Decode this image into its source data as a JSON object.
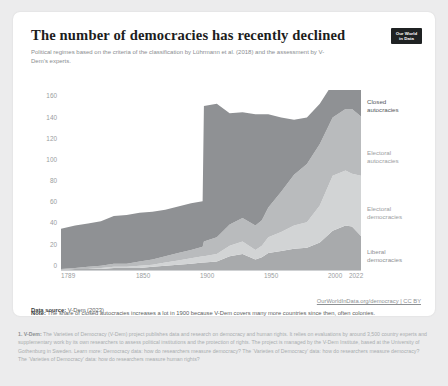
{
  "card": {
    "title": "The number of democracies has recently declined",
    "subtitle": "Political regimes based on the criteria of the classification by Lührmann et al. (2018) and the assessment by V-Dem’s experts.",
    "logo_line1": "Our World",
    "logo_line2": "in Data"
  },
  "footer": {
    "source_label": "Data source:",
    "source_value": "V-Dem (2023)",
    "link": "OurWorldInData.org/democracy | CC BY",
    "note_label": "Note:",
    "note_text": "The share of closed autocracies increases a lot in 1900 because V-Dem covers many more countries since then, often colonies."
  },
  "footnote": {
    "marker": "1. V-Dem:",
    "text": "The Varieties of Democracy (V-Dem) project publishes data and research on democracy and human rights. It relies on evaluations by around 3,500 country experts and supplementary work by its own researchers to assess political institutions and the protection of rights. The project is managed by the V-Dem Institute, based at the University of Gothenburg in Sweden. Learn more: Democracy data: how do researchers measure democracy? The ‘Varieties of Democracy’ data: how do researchers measure democracy? The ‘Varieties of Democracy’ data: how do researchers measure human rights?"
  },
  "chart_data": {
    "type": "area",
    "stacked": true,
    "title": "The number of democracies has recently declined",
    "xlabel": "",
    "ylabel": "",
    "xlim": [
      1789,
      2022
    ],
    "ylim": [
      0,
      170
    ],
    "yticks": [
      0,
      20,
      40,
      60,
      80,
      100,
      120,
      140,
      160
    ],
    "xticks": [
      1789,
      1850,
      1900,
      1950,
      2000,
      2022
    ],
    "grid": false,
    "legend_position": "right",
    "colors": {
      "closed_autocracies": "#8f9194",
      "electoral_autocracies": "#b9bbbd",
      "electoral_democracies": "#d2d4d5",
      "liberal_democracies": "#a8aaac"
    },
    "label_colors": {
      "closed_autocracies": "#55585b",
      "electoral_autocracies": "#9b9ea1",
      "electoral_democracies": "#9b9ea1",
      "liberal_democracies": "#8d9093"
    },
    "x": [
      1789,
      1800,
      1810,
      1820,
      1830,
      1840,
      1850,
      1860,
      1870,
      1880,
      1890,
      1899,
      1900,
      1910,
      1920,
      1930,
      1940,
      1945,
      1950,
      1960,
      1970,
      1980,
      1990,
      2000,
      2010,
      2015,
      2022
    ],
    "series": [
      {
        "name": "Liberal democracies",
        "values": [
          0,
          1,
          1,
          1,
          2,
          2,
          2,
          3,
          4,
          5,
          6,
          7,
          7,
          8,
          13,
          15,
          10,
          12,
          16,
          18,
          20,
          21,
          26,
          37,
          42,
          41,
          32
        ]
      },
      {
        "name": "Electoral democracies",
        "values": [
          0,
          0,
          0,
          1,
          1,
          1,
          2,
          2,
          3,
          4,
          5,
          6,
          6,
          7,
          10,
          12,
          9,
          11,
          15,
          18,
          22,
          24,
          35,
          52,
          52,
          50,
          57
        ]
      },
      {
        "name": "Electoral autocracies",
        "values": [
          1,
          1,
          2,
          2,
          3,
          3,
          4,
          5,
          6,
          7,
          8,
          9,
          14,
          16,
          20,
          22,
          23,
          24,
          28,
          38,
          48,
          55,
          58,
          55,
          58,
          61,
          56
        ]
      },
      {
        "name": "Closed autocracies",
        "values": [
          38,
          40,
          41,
          42,
          45,
          46,
          46,
          45,
          44,
          44,
          44,
          43,
          128,
          126,
          105,
          100,
          105,
          100,
          88,
          70,
          52,
          44,
          38,
          32,
          27,
          27,
          34
        ]
      }
    ],
    "series_label_text": [
      "Closed\nautocracies",
      "Electoral\nautocracies",
      "Electoral\ndemocracies",
      "Liberal\ndemocracies"
    ]
  }
}
